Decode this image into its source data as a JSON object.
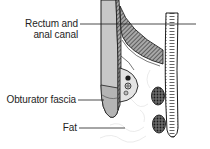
{
  "diagram": {
    "labels": [
      {
        "id": "rectum",
        "line1": "Rectum and",
        "line2": "anal canal"
      },
      {
        "id": "obturator",
        "line1": "Obturator fascia"
      },
      {
        "id": "fat",
        "line1": "Fat"
      }
    ]
  },
  "colors": {
    "ink": "#1e1e1e",
    "rectum_fill": "#c4c4c4",
    "muscle_fill": "#9a9a9a",
    "background": "#ffffff"
  }
}
